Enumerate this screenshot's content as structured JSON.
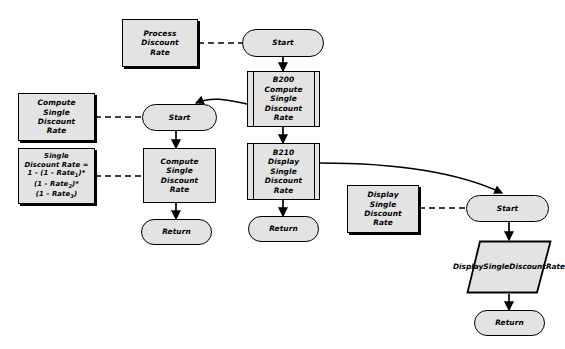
{
  "diagram": {
    "type": "flowchart",
    "fill_color": "#e3e3e3",
    "line_color": "#000000",
    "background": "#ffffff"
  },
  "charts": {
    "process_discount_rate": {
      "annotation": "Process Discount Rate",
      "start": "Start",
      "step_b200": "B200 Compute Single Discount Rate",
      "step_b200_id": "B200",
      "step_b200_lines": [
        "B200",
        "Compute",
        "Single",
        "Discount",
        "Rate"
      ],
      "step_b210_id": "B210",
      "step_b210_lines": [
        "B210",
        "Display",
        "Single",
        "Discount",
        "Rate"
      ],
      "return": "Return"
    },
    "compute_single_discount_rate": {
      "annotation_lines": [
        "Compute",
        "Single",
        "Discount",
        "Rate"
      ],
      "formula_title_lines": [
        "Single",
        "Discount Rate ="
      ],
      "formula_line1_pre": "1 - (1 - Rate",
      "formula_line1_sub": "1",
      "formula_line1_post": ")*",
      "formula_line2_pre": "(1 - Rate",
      "formula_line2_sub": "2",
      "formula_line2_post": ")*",
      "formula_line3_pre": "(1 - Rate",
      "formula_line3_sub": "3",
      "formula_line3_post": ")",
      "start": "Start",
      "process_lines": [
        "Compute",
        "Single",
        "Discount",
        "Rate"
      ],
      "return": "Return"
    },
    "display_single_discount_rate": {
      "annotation_lines": [
        "Display",
        "Single",
        "Discount",
        "Rate"
      ],
      "start": "Start",
      "io_lines": [
        "Display",
        "Single",
        "Discount",
        "Rate"
      ],
      "return": "Return"
    }
  }
}
